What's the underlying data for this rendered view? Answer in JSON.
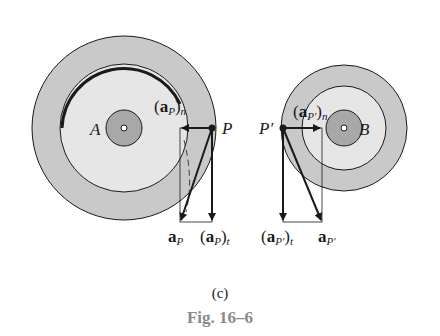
{
  "figure": {
    "panel_label": "(c)",
    "caption": "Fig. 16–6",
    "colors": {
      "outer_ring": "#c9c9c9",
      "inner_disk": "#e6e6e6",
      "hub": "#a8a8a8",
      "line": "#1a1a1a",
      "caption": "#8a8a8a"
    }
  },
  "disk_A": {
    "center_label": "A",
    "point_label": "P",
    "normal_accel": {
      "base": "a",
      "sub": "P",
      "suffix": "n"
    },
    "tangential_accel": {
      "base": "a",
      "sub": "P",
      "suffix": "t"
    },
    "total_accel": {
      "base": "a",
      "sub": "P"
    }
  },
  "disk_B": {
    "center_label": "B",
    "point_label": "P′",
    "normal_accel": {
      "base": "a",
      "sub": "P′",
      "suffix": "n"
    },
    "tangential_accel": {
      "base": "a",
      "sub": "P′",
      "suffix": "t"
    },
    "total_accel": {
      "base": "a",
      "sub": "P′"
    }
  }
}
